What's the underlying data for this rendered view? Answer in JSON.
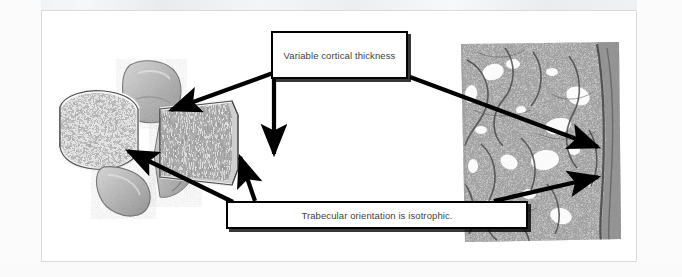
{
  "slide": {
    "background_color": "#ffffff",
    "border_color": "#d8dadc"
  },
  "callouts": {
    "cortical": {
      "text": "Variable cortical thickness",
      "border_color": "#000000",
      "fill_color": "#ffffff",
      "text_color": "#3f3f3f"
    },
    "trabecular": {
      "text": "Trabecular orientation is isotrophic.",
      "border_color": "#000000",
      "fill_color": "#ffffff",
      "text_color": "#3f3f3f"
    }
  },
  "figures": {
    "left": {
      "name": "vertebra-sagittal-section",
      "description": "Grayscale sagittal section of a vertebra showing cortical shell and cancellous trabecular bone"
    },
    "right": {
      "name": "bone-histology-section",
      "description": "Grayscale histological section of trabecular bone with lacunae"
    }
  },
  "arrows": {
    "color": "#000000",
    "items": [
      {
        "name": "arrow-cortical-to-vertebral-endplate",
        "from": [
          231,
          62
        ],
        "to": [
          129,
          99
        ]
      },
      {
        "name": "arrow-cortical-to-vertebral-body",
        "from": [
          232,
          64
        ],
        "to": [
          232,
          143
        ]
      },
      {
        "name": "arrow-cortical-to-histology-right",
        "from": [
          368,
          66
        ],
        "to": [
          556,
          136
        ]
      },
      {
        "name": "arrow-trabecular-to-vertebral-trabeculae",
        "from": [
          191,
          191
        ],
        "to": [
          86,
          140
        ]
      },
      {
        "name": "arrow-trabecular-to-vertebral-mid",
        "from": [
          213,
          190
        ],
        "to": [
          198,
          146
        ]
      },
      {
        "name": "arrow-trabecular-to-histology-lower",
        "from": [
          452,
          190
        ],
        "to": [
          556,
          166
        ]
      }
    ]
  }
}
